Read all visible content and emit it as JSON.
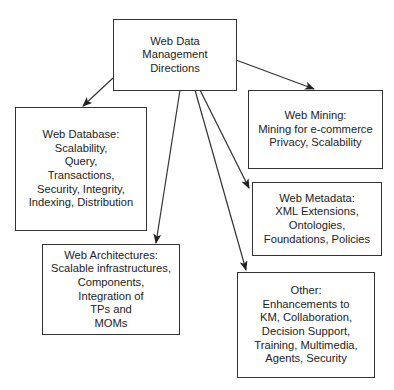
{
  "diagram": {
    "root": {
      "id": "root",
      "lines": [
        "Web Data",
        "Management",
        "Directions"
      ]
    },
    "nodes": [
      {
        "id": "web-database",
        "lines": [
          "Web Database:",
          "Scalability,",
          "Query,",
          "Transactions,",
          "Security, Integrity,",
          "Indexing, Distribution"
        ]
      },
      {
        "id": "web-architectures",
        "lines": [
          "Web Architectures:",
          "Scalable infrastructures,",
          "Components,",
          "Integration of",
          "TPs and",
          "MOMs"
        ]
      },
      {
        "id": "web-mining",
        "lines": [
          "Web Mining:",
          "Mining for e-commerce",
          "Privacy, Scalability"
        ]
      },
      {
        "id": "web-metadata",
        "lines": [
          "Web Metadata:",
          "XML Extensions,",
          "Ontologies,",
          "Foundations, Policies"
        ]
      },
      {
        "id": "other",
        "lines": [
          "Other:",
          "Enhancements to",
          "KM, Collaboration,",
          "Decision Support,",
          "Training, Multimedia,",
          "Agents, Security"
        ]
      }
    ],
    "edges": [
      {
        "from": "root",
        "to": "web-database"
      },
      {
        "from": "root",
        "to": "web-architectures"
      },
      {
        "from": "root",
        "to": "web-mining"
      },
      {
        "from": "root",
        "to": "web-metadata"
      },
      {
        "from": "root",
        "to": "other"
      }
    ],
    "colors": {
      "line": "#333333",
      "text": "#222222",
      "background": "#ffffff"
    }
  }
}
